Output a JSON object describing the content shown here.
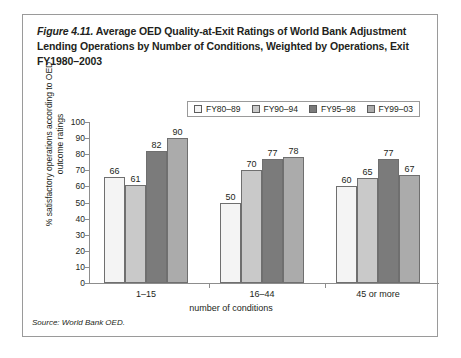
{
  "figure": {
    "number": "Figure 4.11.",
    "title": " Average OED Quality-at-Exit Ratings of World Bank Adjustment Lending Operations by Number of Conditions, Weighted by Operations, Exit FY1980–2003",
    "source": "Source: World Bank OED."
  },
  "colors": {
    "series1": "#f4f4f4",
    "series2": "#c9c9c9",
    "series3": "#7b7b7b",
    "series4": "#ababab",
    "bar_border": "#6f6f6f",
    "axis": "#8d8d8d",
    "frame": "#9a9a9a",
    "text": "#231f20"
  },
  "chart_data": {
    "type": "bar",
    "title": "Average OED Quality-at-Exit Ratings of World Bank Adjustment Lending Operations by Number of Conditions, Weighted by Operations, Exit FY1980–2003",
    "xlabel": "number of conditions",
    "ylabel": "% satisfactory operations according to OED outcome ratings",
    "categories": [
      "1–15",
      "16–44",
      "45 or more"
    ],
    "series": [
      {
        "name": "FY80–89",
        "color": "#f4f4f4",
        "values": [
          66,
          50,
          60
        ]
      },
      {
        "name": "FY90–94",
        "color": "#c9c9c9",
        "values": [
          61,
          70,
          65
        ]
      },
      {
        "name": "FY95–98",
        "color": "#7b7b7b",
        "values": [
          82,
          77,
          77
        ]
      },
      {
        "name": "FY99–03",
        "color": "#ababab",
        "values": [
          90,
          78,
          67
        ]
      }
    ],
    "ylim": [
      0,
      100
    ],
    "yticks": [
      0,
      10,
      20,
      30,
      40,
      50,
      60,
      70,
      80,
      90,
      100
    ],
    "grid": false,
    "legend_position": "top",
    "data_labels": true
  }
}
